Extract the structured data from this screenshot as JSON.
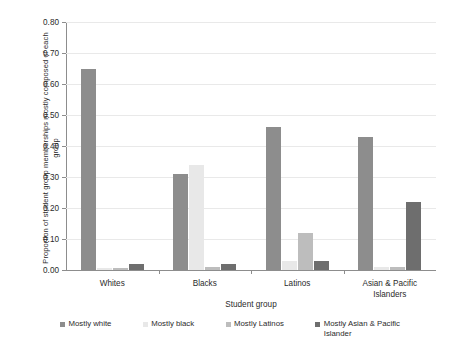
{
  "chart_data": {
    "type": "bar",
    "title": "",
    "xlabel": "Student group",
    "ylabel": "Proportion of student group memberships mostly composed of each group",
    "categories": [
      "Whites",
      "Blacks",
      "Latinos",
      "Asian & Pacific Islanders"
    ],
    "series": [
      {
        "name": "Mostly white",
        "color": "#8d8d8d",
        "values": [
          0.65,
          0.31,
          0.46,
          0.43
        ]
      },
      {
        "name": "Mostly black",
        "color": "#e8e8e8",
        "values": [
          0.005,
          0.34,
          0.03,
          0.01
        ]
      },
      {
        "name": "Mostly Latinos",
        "color": "#bdbdbd",
        "values": [
          0.005,
          0.01,
          0.12,
          0.01
        ]
      },
      {
        "name": "Mostly Asian & Pacific Islander",
        "color": "#6e6e6e",
        "values": [
          0.02,
          0.02,
          0.03,
          0.22
        ]
      }
    ],
    "ylim": [
      0.0,
      0.8
    ],
    "yticks": [
      "0.00",
      "0.10",
      "0.20",
      "0.30",
      "0.40",
      "0.50",
      "0.60",
      "0.70",
      "0.80"
    ],
    "grid": true,
    "legend_position": "bottom"
  },
  "axes": {
    "y_title": "Proportion of student group memberships mostly composed of each group",
    "x_title": "Student group"
  },
  "legend": {
    "items": [
      {
        "label": "Mostly white"
      },
      {
        "label": "Mostly black"
      },
      {
        "label": "Mostly Latinos"
      },
      {
        "label": "Mostly Asian & Pacific\nIslander"
      }
    ]
  }
}
